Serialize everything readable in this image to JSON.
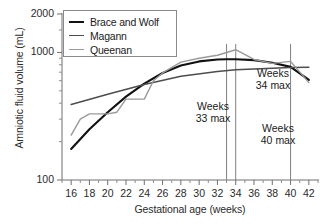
{
  "chart_data": {
    "type": "line",
    "title": "",
    "xlabel": "Gestational age (weeks)",
    "ylabel": "Amniotic fluid volume (mL)",
    "yscale": "log",
    "ylim": [
      100,
      2000
    ],
    "xlim": [
      15,
      43
    ],
    "ytick_labels": [
      "2000",
      "1000",
      "100"
    ],
    "ytick_values": [
      2000,
      1000,
      100
    ],
    "xtick_labels": [
      "16",
      "18",
      "20",
      "22",
      "24",
      "26",
      "28",
      "30",
      "32",
      "34",
      "36",
      "38",
      "40",
      "42"
    ],
    "xtick_values": [
      16,
      18,
      20,
      22,
      24,
      26,
      28,
      30,
      32,
      34,
      36,
      38,
      40,
      42
    ],
    "grid": false,
    "legend_position": "upper left",
    "series": [
      {
        "name": "Brace and Wolf",
        "color": "#111111",
        "width": 2.1,
        "x": [
          16,
          18,
          20,
          22,
          24,
          26,
          28,
          30,
          32,
          33,
          34,
          36,
          38,
          40,
          42
        ],
        "y": [
          175,
          250,
          340,
          450,
          570,
          690,
          790,
          850,
          880,
          885,
          885,
          870,
          830,
          770,
          610
        ]
      },
      {
        "name": "Magann",
        "color": "#4d4d4d",
        "width": 1.5,
        "x": [
          16,
          20,
          24,
          28,
          32,
          34,
          36,
          38,
          40,
          42
        ],
        "y": [
          390,
          470,
          560,
          650,
          710,
          730,
          740,
          750,
          760,
          765
        ]
      },
      {
        "name": "Queenan",
        "color": "#9a9a9a",
        "width": 1.4,
        "x": [
          16,
          17,
          18,
          20,
          21,
          22,
          24,
          25,
          26,
          28,
          30,
          32,
          34,
          36,
          38,
          40,
          42
        ],
        "y": [
          225,
          300,
          330,
          330,
          340,
          430,
          430,
          600,
          690,
          840,
          900,
          950,
          1050,
          880,
          820,
          850,
          580
        ]
      }
    ],
    "annotations": [
      {
        "id": "weeks-33-max",
        "line1": "Weeks",
        "line2": "33 max",
        "x_week": 33,
        "label_x": 213,
        "label_y": 100
      },
      {
        "id": "weeks-34-max",
        "line1": "Weeks",
        "line2": "34 max",
        "x_week": 34,
        "label_x": 273,
        "label_y": 67
      },
      {
        "id": "weeks-40-max",
        "line1": "Weeks",
        "line2": "40 max",
        "x_week": 40,
        "label_x": 278,
        "label_y": 122
      }
    ],
    "reference_lines": [
      {
        "label": "33",
        "week": 33,
        "color": "#808080"
      },
      {
        "label": "34",
        "week": 34,
        "color": "#808080"
      },
      {
        "label": "40",
        "week": 40,
        "color": "#808080"
      }
    ]
  },
  "legend": {
    "items": [
      {
        "label": "Brace and Wolf",
        "color": "#111111",
        "thickness": "2.6px"
      },
      {
        "label": "Magann",
        "color": "#4d4d4d",
        "thickness": "1.8px"
      },
      {
        "label": "Queenan",
        "color": "#9a9a9a",
        "thickness": "1.6px"
      }
    ]
  },
  "axes": {
    "y_title": "Amniotic fluid volume (mL)",
    "x_title": "Gestational age (weeks)"
  }
}
